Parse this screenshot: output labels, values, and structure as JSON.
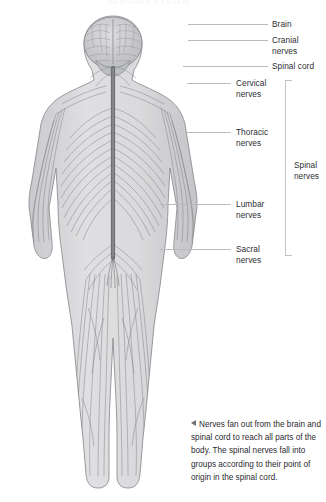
{
  "header": {
    "text": "NERVOUS SYSTEM"
  },
  "figure": {
    "alt_name": "human-nervous-system-illustration",
    "colors": {
      "body_fill": "#d8d8da",
      "body_outline": "#8d8e92",
      "nerve_stroke": "#77787c",
      "spinal_cord": "#6d6e72",
      "brain_fill": "#c9cacd",
      "background": "#ffffff"
    }
  },
  "labels": [
    {
      "id": "brain",
      "text": "Brain",
      "x": 272,
      "y": 19,
      "line_x": 188,
      "line_w": 80,
      "line_y": 24
    },
    {
      "id": "cranial-nerves",
      "text": "Cranial nerves",
      "x": 272,
      "y": 35,
      "line_x": 188,
      "line_w": 80,
      "line_y": 40
    },
    {
      "id": "spinal-cord",
      "text": "Spinal cord",
      "x": 272,
      "y": 61,
      "line_x": 183,
      "line_w": 85,
      "line_y": 66
    },
    {
      "id": "cervical-nerves",
      "text": "Cervical\nnerves",
      "x": 236,
      "y": 78,
      "line_x": 187,
      "line_w": 44,
      "line_y": 83
    },
    {
      "id": "thoracic-nerves",
      "text": "Thoracic\nnerves",
      "x": 236,
      "y": 127,
      "line_x": 185,
      "line_w": 46,
      "line_y": 132
    },
    {
      "id": "lumbar-nerves",
      "text": "Lumbar\nnerves",
      "x": 236,
      "y": 199,
      "line_x": 160,
      "line_w": 71,
      "line_y": 204
    },
    {
      "id": "sacral-nerves",
      "text": "Sacral\nnerves",
      "x": 236,
      "y": 244,
      "line_x": 160,
      "line_w": 71,
      "line_y": 249
    }
  ],
  "bracket": {
    "label": "Spinal\nnerves"
  },
  "caption": {
    "text": "Nerves fan out from the brain and spinal cord to reach all parts of the body. The spinal nerves fall into groups according to their point of origin in the spinal cord.",
    "marker": "left-triangle-icon"
  }
}
